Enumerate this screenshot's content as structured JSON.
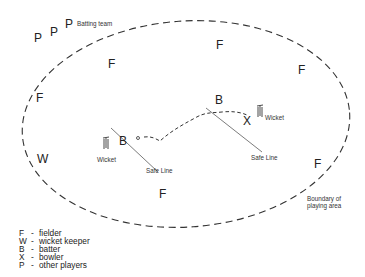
{
  "diagram": {
    "title_label": "Batting team",
    "boundary_label_line1": "Boundary of",
    "boundary_label_line2": "playing area",
    "safe_line_label": "Safe Line",
    "wicket_label": "Wicket",
    "players": {
      "other": "P",
      "fielder": "F",
      "wicket_keeper": "W",
      "batter": "B",
      "bowler": "X"
    },
    "colors": {
      "line": "#333333",
      "text": "#222222",
      "background": "#ffffff"
    }
  },
  "legend": {
    "items": [
      {
        "key": "F",
        "sep": "-",
        "label": "fielder"
      },
      {
        "key": "W",
        "sep": "-",
        "label": "wicket keeper"
      },
      {
        "key": "B",
        "sep": "-",
        "label": "batter"
      },
      {
        "key": "X",
        "sep": "-",
        "label": "bowler"
      },
      {
        "key": "P",
        "sep": "-",
        "label": "other players"
      }
    ]
  }
}
